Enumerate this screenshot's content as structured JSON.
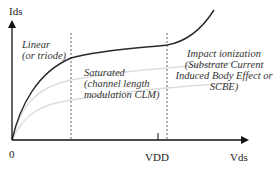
{
  "diagram": {
    "axes": {
      "y_label": "Ids",
      "x_label": "Vds",
      "origin_label": "0",
      "x_tick_label": "VDD"
    },
    "regions": [
      {
        "id": "linear",
        "lines": [
          "Linear",
          "(or triode)"
        ]
      },
      {
        "id": "saturated",
        "lines": [
          "Saturated",
          "(channel length",
          "modulation CLM)"
        ]
      },
      {
        "id": "impact",
        "lines": [
          "Impact ionization",
          "(Substrate Current",
          "Induced Body Effect or",
          "SCBE)"
        ]
      }
    ],
    "curves": [
      {
        "name": "high-vgs-curve",
        "style": "dark"
      },
      {
        "name": "mid-vgs-curve",
        "style": "light"
      },
      {
        "name": "low-vgs-curve",
        "style": "light"
      }
    ],
    "colors": {
      "axis": "#111111",
      "main_curve": "#2a2a2a",
      "light_curve": "#d9d9d9",
      "divider": "#555555",
      "text": "#222222"
    }
  }
}
